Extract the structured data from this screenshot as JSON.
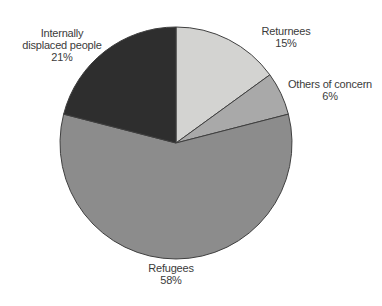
{
  "chart_data": {
    "type": "pie",
    "categories": [
      "Returnees",
      "Others of concern",
      "Refugees",
      "Internally displaced people"
    ],
    "values": [
      15,
      6,
      58,
      21
    ],
    "unit": "%",
    "colors": [
      "#d3d3d1",
      "#a9a9a9",
      "#8c8c8c",
      "#2e2e2e"
    ],
    "stroke": "#3f3f3f",
    "start_angle_deg": 0,
    "direction": "clockwise",
    "legend_position": "none",
    "background": "#ffffff",
    "labels": {
      "returnees": {
        "lines": [
          "Returnees",
          "15%"
        ]
      },
      "others": {
        "lines": [
          "Others of concern",
          "6%"
        ]
      },
      "refugees": {
        "lines": [
          "Refugees",
          "58%"
        ]
      },
      "idp": {
        "lines": [
          "Internally",
          "displaced people",
          "21%"
        ]
      }
    }
  }
}
